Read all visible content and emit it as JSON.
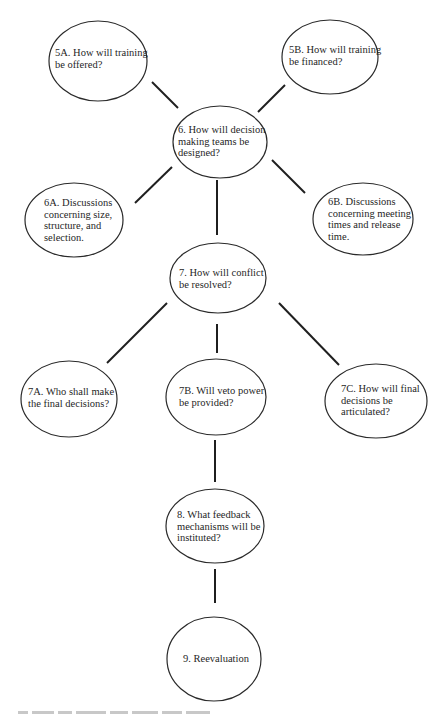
{
  "diagram": {
    "type": "flow-hierarchy",
    "colors": {
      "background": "#ffffff",
      "stroke": "#2a2a2a",
      "text": "#1f1f1f"
    },
    "nodes": [
      {
        "id": "5A",
        "cx": 98,
        "cy": 61,
        "rx": 49,
        "ry": 40,
        "label_x": 55,
        "label_y": 47,
        "lines": [
          "5A. How will training",
          "be offered?"
        ]
      },
      {
        "id": "5B",
        "cx": 330,
        "cy": 57,
        "rx": 48,
        "ry": 37,
        "label_x": 289,
        "label_y": 44,
        "lines": [
          "5B. How will training",
          "be financed?"
        ]
      },
      {
        "id": "6",
        "cx": 220,
        "cy": 142,
        "rx": 47,
        "ry": 36,
        "label_x": 178,
        "label_y": 124,
        "lines": [
          "6. How will decision",
          "making teams be",
          "designed?"
        ]
      },
      {
        "id": "6A",
        "cx": 74,
        "cy": 220,
        "rx": 49,
        "ry": 37,
        "label_x": 44,
        "label_y": 197,
        "lines": [
          "6A. Discussions",
          "concerning size,",
          "structure, and",
          "selection."
        ]
      },
      {
        "id": "6B",
        "cx": 363,
        "cy": 219,
        "rx": 50,
        "ry": 36,
        "label_x": 328,
        "label_y": 196,
        "lines": [
          "6B. Discussions",
          "concerning meeting",
          "times and release",
          "time."
        ]
      },
      {
        "id": "7",
        "cx": 218,
        "cy": 278,
        "rx": 48,
        "ry": 35,
        "label_x": 179,
        "label_y": 267,
        "lines": [
          "7. How will conflict",
          "be resolved?"
        ]
      },
      {
        "id": "7A",
        "cx": 69,
        "cy": 399,
        "rx": 48,
        "ry": 38,
        "label_x": 28,
        "label_y": 386,
        "lines": [
          "7A. Who shall make",
          "the final decisions?"
        ]
      },
      {
        "id": "7B",
        "cx": 216,
        "cy": 397,
        "rx": 50,
        "ry": 38,
        "label_x": 179,
        "label_y": 385,
        "lines": [
          "7B. Will veto power",
          "be provided?"
        ]
      },
      {
        "id": "7C",
        "cx": 376,
        "cy": 401,
        "rx": 51,
        "ry": 37,
        "label_x": 341,
        "label_y": 383,
        "lines": [
          "7C. How will final",
          "decisions be",
          "articulated?"
        ]
      },
      {
        "id": "8",
        "cx": 215,
        "cy": 526,
        "rx": 49,
        "ry": 37,
        "label_x": 177,
        "label_y": 509,
        "lines": [
          "8. What feedback",
          "mechanisms will be",
          "instituted?"
        ]
      },
      {
        "id": "9",
        "cx": 214,
        "cy": 659,
        "rx": 47,
        "ry": 42,
        "label_x": 183,
        "label_y": 653,
        "lines": [
          "9. Reevaluation"
        ]
      }
    ],
    "edges": [
      {
        "from": "5A",
        "to": "6",
        "x1": 152,
        "y1": 82,
        "x2": 178,
        "y2": 108
      },
      {
        "from": "5B",
        "to": "6",
        "x1": 285,
        "y1": 85,
        "x2": 258,
        "y2": 112
      },
      {
        "from": "6",
        "to": "6A",
        "x1": 172,
        "y1": 167,
        "x2": 135,
        "y2": 203
      },
      {
        "from": "6",
        "to": "6B",
        "x1": 272,
        "y1": 160,
        "x2": 305,
        "y2": 193
      },
      {
        "from": "6",
        "to": "7",
        "x1": 217,
        "y1": 180,
        "x2": 217,
        "y2": 235
      },
      {
        "from": "7",
        "to": "7A",
        "x1": 167,
        "y1": 303,
        "x2": 107,
        "y2": 363
      },
      {
        "from": "7",
        "to": "7B",
        "x1": 217,
        "y1": 324,
        "x2": 217,
        "y2": 353
      },
      {
        "from": "7",
        "to": "7C",
        "x1": 279,
        "y1": 303,
        "x2": 339,
        "y2": 365
      },
      {
        "from": "7B",
        "to": "8",
        "x1": 215,
        "y1": 440,
        "x2": 215,
        "y2": 482
      },
      {
        "from": "8",
        "to": "9",
        "x1": 215,
        "y1": 569,
        "x2": 215,
        "y2": 603
      }
    ]
  },
  "caption": {
    "visible": "partial-cut-off",
    "fragment_widths": [
      10,
      22,
      14,
      30,
      18,
      26,
      20,
      24
    ]
  }
}
